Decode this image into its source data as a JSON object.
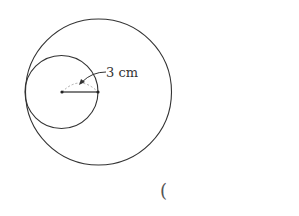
{
  "diagram": {
    "label": "3 cm",
    "answer_paren": "(",
    "colors": {
      "stroke": "#333333",
      "dash": "#aaaaaa"
    },
    "big_circle": {
      "cx": 98.5,
      "cy": 92,
      "r": 73
    },
    "small_circle": {
      "cx": 61,
      "cy": 92,
      "r": 37
    }
  }
}
